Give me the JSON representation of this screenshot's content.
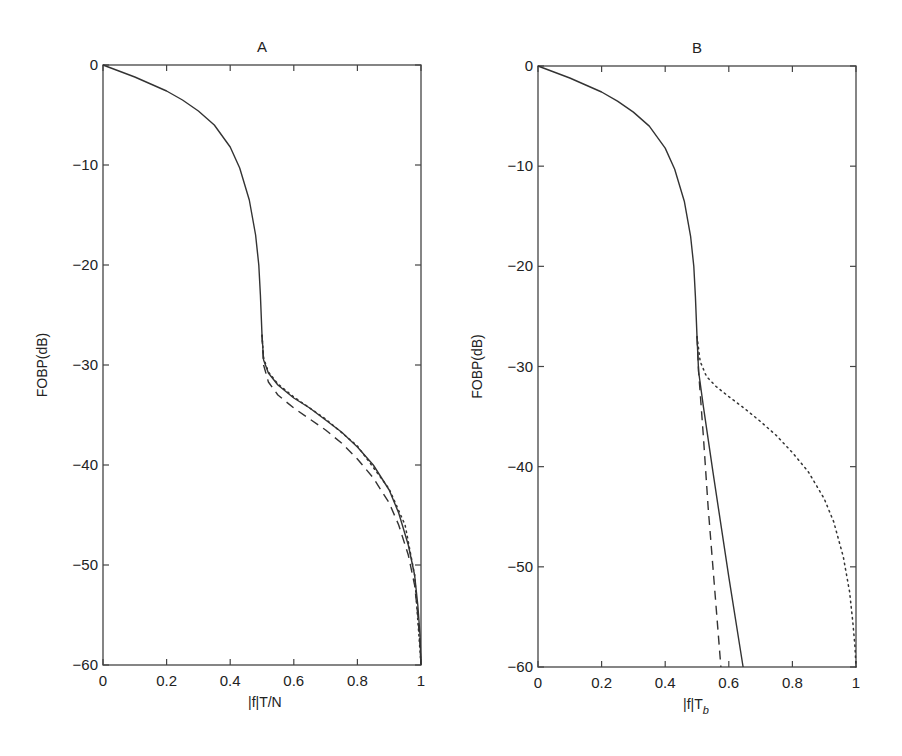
{
  "chart_data": [
    {
      "type": "line",
      "title": "A",
      "xlabel": "|f|T/N",
      "ylabel": "FOBP(dB)",
      "xlim": [
        0,
        1
      ],
      "ylim": [
        -60,
        0
      ],
      "xticks": [
        "0",
        "0.2",
        "0.4",
        "0.6",
        "0.8",
        "1"
      ],
      "yticks": [
        "0",
        "-10",
        "-20",
        "-30",
        "-40",
        "-50",
        "-60"
      ],
      "grid": false,
      "legend": null,
      "series": [
        {
          "name": "solid",
          "style": "solid",
          "x": [
            0,
            0.05,
            0.1,
            0.15,
            0.2,
            0.25,
            0.3,
            0.35,
            0.4,
            0.43,
            0.46,
            0.48,
            0.49,
            0.495,
            0.5,
            0.505,
            0.52,
            0.55,
            0.6,
            0.65,
            0.7,
            0.75,
            0.8,
            0.85,
            0.9,
            0.93,
            0.96,
            0.98,
            0.99,
            0.997,
            1
          ],
          "y": [
            0,
            -0.6,
            -1.2,
            -1.9,
            -2.6,
            -3.5,
            -4.6,
            -6.0,
            -8.2,
            -10.3,
            -13.5,
            -17,
            -20,
            -23,
            -27,
            -29.5,
            -30.8,
            -32,
            -33.3,
            -34.3,
            -35.5,
            -36.7,
            -38.2,
            -40,
            -42.5,
            -44.8,
            -48,
            -51,
            -54,
            -57,
            -60
          ]
        },
        {
          "name": "dotted",
          "style": "dotted",
          "x": [
            0.5,
            0.505,
            0.52,
            0.55,
            0.6,
            0.7,
            0.8,
            0.9,
            0.95,
            0.98,
            1
          ],
          "y": [
            -27,
            -29.3,
            -30.7,
            -31.9,
            -33.2,
            -35.4,
            -38.1,
            -42.4,
            -46,
            -51,
            -60
          ]
        },
        {
          "name": "dashed",
          "style": "dashed",
          "x": [
            0.5,
            0.505,
            0.52,
            0.55,
            0.6,
            0.65,
            0.7,
            0.75,
            0.8,
            0.85,
            0.9,
            0.93,
            0.96,
            0.98,
            0.99,
            0.997,
            1
          ],
          "y": [
            -27,
            -30,
            -31.7,
            -33,
            -34.3,
            -35.4,
            -36.5,
            -37.8,
            -39.4,
            -41.3,
            -43.8,
            -46,
            -49,
            -52,
            -55,
            -58,
            -60
          ]
        }
      ]
    },
    {
      "type": "line",
      "title": "B",
      "xlabel": "|f|T_b",
      "ylabel": "FOBP(dB)",
      "xlim": [
        0,
        1
      ],
      "ylim": [
        -60,
        0
      ],
      "xticks": [
        "0",
        "0.2",
        "0.4",
        "0.6",
        "0.8",
        "1"
      ],
      "yticks": [
        "0",
        "-10",
        "-20",
        "-30",
        "-40",
        "-50",
        "-60"
      ],
      "grid": false,
      "legend": null,
      "series": [
        {
          "name": "solid",
          "style": "solid",
          "x": [
            0,
            0.05,
            0.1,
            0.15,
            0.2,
            0.25,
            0.3,
            0.35,
            0.4,
            0.43,
            0.46,
            0.48,
            0.49,
            0.495,
            0.5,
            0.505,
            0.52,
            0.55,
            0.6,
            0.645
          ],
          "y": [
            0,
            -0.6,
            -1.2,
            -1.9,
            -2.6,
            -3.5,
            -4.6,
            -6.0,
            -8.2,
            -10.3,
            -13.5,
            -17,
            -20,
            -23,
            -27,
            -30.5,
            -34,
            -40.5,
            -51,
            -60
          ]
        },
        {
          "name": "dashed",
          "style": "dashed",
          "x": [
            0.5,
            0.505,
            0.52,
            0.535,
            0.55,
            0.565,
            0.575
          ],
          "y": [
            -27,
            -30.5,
            -37,
            -44,
            -50,
            -56,
            -60
          ]
        },
        {
          "name": "dotted",
          "style": "dotted",
          "x": [
            0.5,
            0.51,
            0.53,
            0.56,
            0.6,
            0.65,
            0.7,
            0.75,
            0.8,
            0.85,
            0.9,
            0.93,
            0.96,
            0.98,
            0.99,
            0.997,
            1
          ],
          "y": [
            -27,
            -29.5,
            -31,
            -32,
            -33,
            -34.2,
            -35.5,
            -36.9,
            -38.6,
            -40.5,
            -43.2,
            -45.5,
            -49,
            -52.5,
            -55.5,
            -58,
            -60
          ]
        }
      ]
    }
  ],
  "panels": [
    {
      "title": "A",
      "xlabel_main": "|f|T/N",
      "xlabel_sub": "",
      "ylabel": "FOBP(dB)"
    },
    {
      "title": "B",
      "xlabel_main": "|f|T",
      "xlabel_sub": "b",
      "ylabel": "FOBP(dB)"
    }
  ],
  "colors": {
    "line": "#333333",
    "axis": "#444444"
  }
}
